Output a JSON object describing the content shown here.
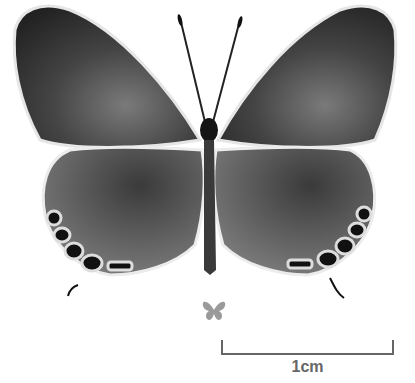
{
  "image": {
    "subject": "butterfly specimen, dorsal view",
    "palette": {
      "wing_dark": "#2a2a2a",
      "wing_mid": "#555555",
      "wing_light": "#8a8a8a",
      "fringe": "#e8e8e8",
      "background": "#ffffff",
      "scale_gray": "#666666",
      "mini_icon": "#9a9a9a"
    }
  },
  "scale_bar": {
    "label": "1cm"
  },
  "actual_size_icon": {
    "name": "butterfly-silhouette"
  }
}
